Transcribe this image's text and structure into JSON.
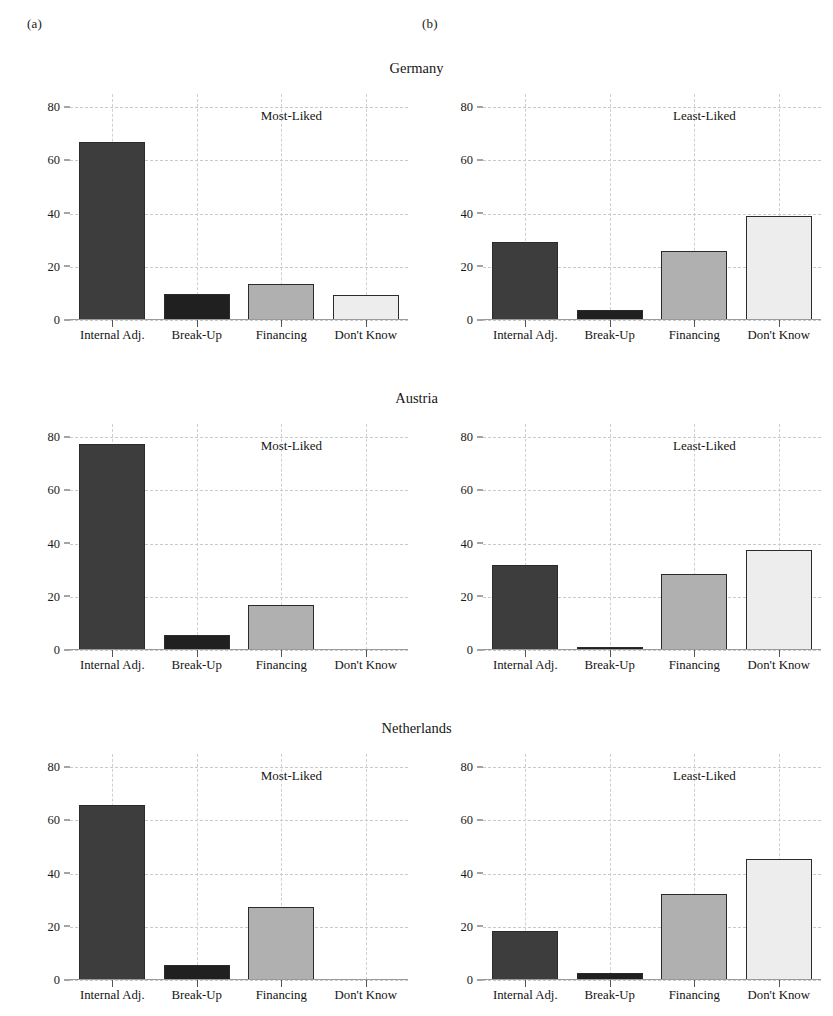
{
  "figure": {
    "panel_letters": [
      "(a)",
      "(b)"
    ],
    "categories": [
      "Internal Adj.",
      "Break-Up",
      "Financing",
      "Don't Know"
    ],
    "y_ticks": [
      0,
      20,
      40,
      60,
      80
    ],
    "ylim": [
      0,
      85
    ],
    "left_annotation": "Most-Liked",
    "right_annotation": "Least-Liked",
    "bar_colors": [
      "#3d3d3d",
      "#202020",
      "#b0b0b0",
      "#ededed"
    ],
    "bar_border_color": "#2b2b2b",
    "grid_color": "#c9c9c9",
    "background": "#ffffff"
  },
  "rows": [
    {
      "country": "Germany",
      "left": {
        "annotation": "Most-Liked",
        "values": [
          67,
          9.8,
          13.5,
          9.5
        ]
      },
      "right": {
        "annotation": "Least-Liked",
        "values": [
          29.5,
          3.8,
          26,
          39
        ]
      }
    },
    {
      "country": "Austria",
      "left": {
        "annotation": "Most-Liked",
        "values": [
          77.5,
          5.8,
          17,
          0
        ]
      },
      "right": {
        "annotation": "Least-Liked",
        "values": [
          32,
          1,
          28.5,
          37.5
        ]
      }
    },
    {
      "country": "Netherlands",
      "left": {
        "annotation": "Most-Liked",
        "values": [
          66,
          5.5,
          27.5,
          0
        ]
      },
      "right": {
        "annotation": "Least-Liked",
        "values": [
          18.5,
          2.5,
          32.5,
          45.5
        ]
      }
    }
  ],
  "chart_data": {
    "type": "bar",
    "title": "",
    "xlabel": "",
    "ylabel": "",
    "ylim": [
      0,
      85
    ],
    "y_ticks": [
      0,
      20,
      40,
      60,
      80
    ],
    "grid": true,
    "legend": "none",
    "categories": [
      "Internal Adj.",
      "Break-Up",
      "Financing",
      "Don't Know"
    ],
    "panels": [
      {
        "panel": "(a)",
        "annotation": "Most-Liked",
        "country": "Germany",
        "values": [
          67,
          9.8,
          13.5,
          9.5
        ]
      },
      {
        "panel": "(b)",
        "annotation": "Least-Liked",
        "country": "Germany",
        "values": [
          29.5,
          3.8,
          26,
          39
        ]
      },
      {
        "panel": "(a)",
        "annotation": "Most-Liked",
        "country": "Austria",
        "values": [
          77.5,
          5.8,
          17,
          0
        ]
      },
      {
        "panel": "(b)",
        "annotation": "Least-Liked",
        "country": "Austria",
        "values": [
          32,
          1,
          28.5,
          37.5
        ]
      },
      {
        "panel": "(a)",
        "annotation": "Most-Liked",
        "country": "Netherlands",
        "values": [
          66,
          5.5,
          27.5,
          0
        ]
      },
      {
        "panel": "(b)",
        "annotation": "Least-Liked",
        "country": "Netherlands",
        "values": [
          18.5,
          2.5,
          32.5,
          45.5
        ]
      }
    ]
  }
}
